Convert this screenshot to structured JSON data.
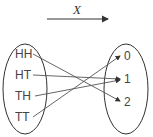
{
  "diagram": {
    "function_label": "X",
    "domain_set": [
      "HH",
      "HT",
      "TH",
      "TT"
    ],
    "codomain_set": [
      "0",
      "1",
      "2"
    ],
    "mappings": [
      {
        "from": "HH",
        "to": "2"
      },
      {
        "from": "HT",
        "to": "1"
      },
      {
        "from": "TH",
        "to": "1"
      },
      {
        "from": "TT",
        "to": "0"
      }
    ],
    "line_color": "#555555"
  }
}
